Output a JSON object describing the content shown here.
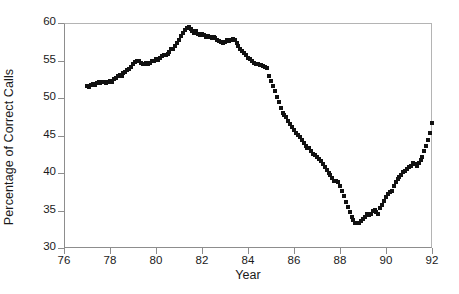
{
  "chart_data": {
    "type": "scatter",
    "title": "",
    "xlabel": "Year",
    "ylabel": "Percentage of Correct Calls",
    "xlim": [
      76,
      92
    ],
    "ylim": [
      30,
      60
    ],
    "xticks": [
      76,
      78,
      80,
      82,
      84,
      86,
      88,
      90,
      92
    ],
    "yticks": [
      30,
      35,
      40,
      45,
      50,
      55,
      60
    ],
    "grid": false,
    "legend": null,
    "marker": "filled-square",
    "marker_color": "#111111",
    "series": [
      {
        "name": "Percentage of Correct Calls",
        "points": [
          [
            77.0,
            51.6
          ],
          [
            77.08,
            51.5
          ],
          [
            77.17,
            51.7
          ],
          [
            77.25,
            51.9
          ],
          [
            77.33,
            51.8
          ],
          [
            77.42,
            52.0
          ],
          [
            77.5,
            52.1
          ],
          [
            77.58,
            52.0
          ],
          [
            77.67,
            52.2
          ],
          [
            77.75,
            52.1
          ],
          [
            77.83,
            52.0
          ],
          [
            77.92,
            52.2
          ],
          [
            78.0,
            52.3
          ],
          [
            78.08,
            52.2
          ],
          [
            78.17,
            52.5
          ],
          [
            78.25,
            52.7
          ],
          [
            78.33,
            52.9
          ],
          [
            78.42,
            53.1
          ],
          [
            78.5,
            53.0
          ],
          [
            78.58,
            53.3
          ],
          [
            78.67,
            53.5
          ],
          [
            78.75,
            53.7
          ],
          [
            78.83,
            53.9
          ],
          [
            78.92,
            54.2
          ],
          [
            79.0,
            54.5
          ],
          [
            79.08,
            54.8
          ],
          [
            79.17,
            55.0
          ],
          [
            79.25,
            54.9
          ],
          [
            79.33,
            54.7
          ],
          [
            79.42,
            54.6
          ],
          [
            79.5,
            54.6
          ],
          [
            79.58,
            54.7
          ],
          [
            79.67,
            54.6
          ],
          [
            79.75,
            54.7
          ],
          [
            79.83,
            54.9
          ],
          [
            79.92,
            55.0
          ],
          [
            80.0,
            55.2
          ],
          [
            80.08,
            55.1
          ],
          [
            80.17,
            55.3
          ],
          [
            80.25,
            55.6
          ],
          [
            80.33,
            55.8
          ],
          [
            80.42,
            55.7
          ],
          [
            80.5,
            55.9
          ],
          [
            80.58,
            56.2
          ],
          [
            80.67,
            56.5
          ],
          [
            80.75,
            56.6
          ],
          [
            80.83,
            56.9
          ],
          [
            80.92,
            57.3
          ],
          [
            81.0,
            57.8
          ],
          [
            81.08,
            58.3
          ],
          [
            81.17,
            58.7
          ],
          [
            81.25,
            59.1
          ],
          [
            81.33,
            59.4
          ],
          [
            81.42,
            59.5
          ],
          [
            81.5,
            59.2
          ],
          [
            81.58,
            58.9
          ],
          [
            81.67,
            58.7
          ],
          [
            81.75,
            58.9
          ],
          [
            81.83,
            58.6
          ],
          [
            81.92,
            58.4
          ],
          [
            82.0,
            58.6
          ],
          [
            82.08,
            58.4
          ],
          [
            82.17,
            58.2
          ],
          [
            82.25,
            58.3
          ],
          [
            82.33,
            58.1
          ],
          [
            82.42,
            58.0
          ],
          [
            82.5,
            58.2
          ],
          [
            82.58,
            58.0
          ],
          [
            82.67,
            57.8
          ],
          [
            82.75,
            57.6
          ],
          [
            82.83,
            57.5
          ],
          [
            82.92,
            57.4
          ],
          [
            83.0,
            57.5
          ],
          [
            83.08,
            57.7
          ],
          [
            83.17,
            57.6
          ],
          [
            83.25,
            57.8
          ],
          [
            83.33,
            57.9
          ],
          [
            83.42,
            57.8
          ],
          [
            83.5,
            57.4
          ],
          [
            83.58,
            57.0
          ],
          [
            83.67,
            56.6
          ],
          [
            83.75,
            56.3
          ],
          [
            83.83,
            56.0
          ],
          [
            83.92,
            55.7
          ],
          [
            84.0,
            55.4
          ],
          [
            84.08,
            55.2
          ],
          [
            84.17,
            55.0
          ],
          [
            84.25,
            54.7
          ],
          [
            84.33,
            54.5
          ],
          [
            84.42,
            54.6
          ],
          [
            84.5,
            54.4
          ],
          [
            84.58,
            54.4
          ],
          [
            84.67,
            54.3
          ],
          [
            84.75,
            54.2
          ],
          [
            84.83,
            54.0
          ],
          [
            84.92,
            53.0
          ],
          [
            85.0,
            52.3
          ],
          [
            85.08,
            51.6
          ],
          [
            85.17,
            50.9
          ],
          [
            85.25,
            50.2
          ],
          [
            85.33,
            49.5
          ],
          [
            85.42,
            48.7
          ],
          [
            85.5,
            48.0
          ],
          [
            85.58,
            47.8
          ],
          [
            85.67,
            47.5
          ],
          [
            85.75,
            47.0
          ],
          [
            85.83,
            46.6
          ],
          [
            85.92,
            46.2
          ],
          [
            86.0,
            45.8
          ],
          [
            86.08,
            45.4
          ],
          [
            86.17,
            45.1
          ],
          [
            86.25,
            44.8
          ],
          [
            86.33,
            44.4
          ],
          [
            86.42,
            44.0
          ],
          [
            86.5,
            43.6
          ],
          [
            86.58,
            43.3
          ],
          [
            86.67,
            43.4
          ],
          [
            86.75,
            43.0
          ],
          [
            86.83,
            42.6
          ],
          [
            86.92,
            42.4
          ],
          [
            87.0,
            42.2
          ],
          [
            87.08,
            41.9
          ],
          [
            87.17,
            41.6
          ],
          [
            87.25,
            41.2
          ],
          [
            87.33,
            40.8
          ],
          [
            87.42,
            40.4
          ],
          [
            87.5,
            40.0
          ],
          [
            87.58,
            39.7
          ],
          [
            87.67,
            39.3
          ],
          [
            87.75,
            39.0
          ],
          [
            87.83,
            38.9
          ],
          [
            87.92,
            38.8
          ],
          [
            88.0,
            38.3
          ],
          [
            88.08,
            37.6
          ],
          [
            88.17,
            36.9
          ],
          [
            88.25,
            36.2
          ],
          [
            88.33,
            35.5
          ],
          [
            88.42,
            34.8
          ],
          [
            88.5,
            34.2
          ],
          [
            88.58,
            33.7
          ],
          [
            88.67,
            33.4
          ],
          [
            88.75,
            33.3
          ],
          [
            88.83,
            33.4
          ],
          [
            88.92,
            33.6
          ],
          [
            89.0,
            33.9
          ],
          [
            89.08,
            34.2
          ],
          [
            89.17,
            34.6
          ],
          [
            89.25,
            34.4
          ],
          [
            89.33,
            34.6
          ],
          [
            89.42,
            34.9
          ],
          [
            89.5,
            35.1
          ],
          [
            89.58,
            34.8
          ],
          [
            89.67,
            34.6
          ],
          [
            89.75,
            35.3
          ],
          [
            89.83,
            35.8
          ],
          [
            89.92,
            36.3
          ],
          [
            90.0,
            36.8
          ],
          [
            90.08,
            37.2
          ],
          [
            90.17,
            37.5
          ],
          [
            90.25,
            37.6
          ],
          [
            90.33,
            38.3
          ],
          [
            90.42,
            38.8
          ],
          [
            90.5,
            39.2
          ],
          [
            90.58,
            39.5
          ],
          [
            90.67,
            39.8
          ],
          [
            90.75,
            40.2
          ],
          [
            90.83,
            40.3
          ],
          [
            90.92,
            40.5
          ],
          [
            91.0,
            40.8
          ],
          [
            91.08,
            41.0
          ],
          [
            91.17,
            41.3
          ],
          [
            91.25,
            41.2
          ],
          [
            91.33,
            41.0
          ],
          [
            91.42,
            41.3
          ],
          [
            91.5,
            41.7
          ],
          [
            91.58,
            42.2
          ],
          [
            91.67,
            42.9
          ],
          [
            91.75,
            43.6
          ],
          [
            91.83,
            44.4
          ],
          [
            91.92,
            45.4
          ],
          [
            92.0,
            46.7
          ]
        ]
      }
    ]
  }
}
